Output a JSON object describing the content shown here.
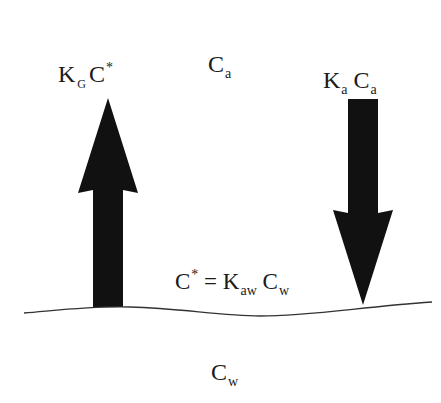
{
  "diagram": {
    "top_phase_label": {
      "main": "C",
      "sub": "a"
    },
    "bottom_phase_label": {
      "main": "C",
      "sub": "w"
    },
    "up_arrow_label": {
      "k": "K",
      "k_sub": "G",
      "c": "C",
      "c_sup": "*"
    },
    "down_arrow_label": {
      "k": "K",
      "k_sub": "a",
      "c": "C",
      "c_sub": "a"
    },
    "interface_equation": {
      "lhs": "C",
      "lhs_sup": "*",
      "eq": "=",
      "k": "K",
      "k_sub": "aw",
      "c": "C",
      "c_sub": "w"
    },
    "colors": {
      "arrow": "#111111",
      "line": "#333333",
      "background": "#ffffff"
    }
  }
}
